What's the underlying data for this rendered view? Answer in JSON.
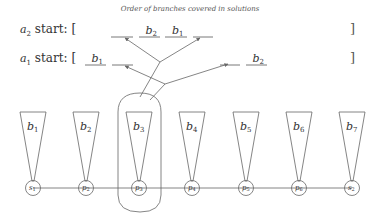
{
  "title": "Order of branches covered in solutions",
  "rows": [
    {
      "id": "a2",
      "label_var": "a",
      "label_sub": "2",
      "label_rest": " start: [",
      "close": "]",
      "slots": [
        {
          "x1": 111,
          "x2": 133,
          "var": "",
          "sub": ""
        },
        {
          "x1": 139,
          "x2": 160,
          "var": "b",
          "sub": "2"
        },
        {
          "x1": 165,
          "x2": 187,
          "var": "b",
          "sub": "1"
        },
        {
          "x1": 193,
          "x2": 213,
          "var": "",
          "sub": ""
        }
      ]
    },
    {
      "id": "a1",
      "label_var": "a",
      "label_sub": "1",
      "label_rest": " start: [",
      "close": "]",
      "slots": [
        {
          "x1": 85,
          "x2": 106,
          "var": "b",
          "sub": "1"
        },
        {
          "x1": 112,
          "x2": 133,
          "var": "",
          "sub": ""
        },
        {
          "x1": 220,
          "x2": 240,
          "var": "",
          "sub": ""
        },
        {
          "x1": 246,
          "x2": 267,
          "var": "b",
          "sub": "2"
        }
      ]
    }
  ],
  "branches": [
    {
      "var": "b",
      "sub": "1"
    },
    {
      "var": "b",
      "sub": "2"
    },
    {
      "var": "b",
      "sub": "3"
    },
    {
      "var": "b",
      "sub": "4"
    },
    {
      "var": "b",
      "sub": "5"
    },
    {
      "var": "b",
      "sub": "6"
    },
    {
      "var": "b",
      "sub": "7"
    }
  ],
  "nodes": [
    {
      "var": "s",
      "sub": "1"
    },
    {
      "var": "p",
      "sub": "2"
    },
    {
      "var": "p",
      "sub": "3"
    },
    {
      "var": "p",
      "sub": "4"
    },
    {
      "var": "p",
      "sub": "5"
    },
    {
      "var": "p",
      "sub": "6"
    },
    {
      "var": "s",
      "sub": "2"
    }
  ],
  "highlighted_node_index": 2,
  "colors": {
    "stroke": "#666666",
    "text": "#333333",
    "background": "#ffffff"
  }
}
